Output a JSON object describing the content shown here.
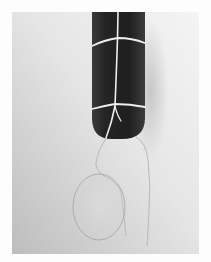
{
  "image": {
    "type": "photograph",
    "style": "grayscale",
    "description": "Dark cylindrical object with a rounded end, bound with white string, with a thin loop and translucent oval hanging below against a light gray backdrop",
    "colors": {
      "border": "#fdfdfd",
      "backdrop_light": "#f2f2f2",
      "backdrop_dark": "#b9b9b9",
      "object": "#2b2b2b",
      "string": "#efefef",
      "oval_line": "#a9a9a9"
    }
  }
}
